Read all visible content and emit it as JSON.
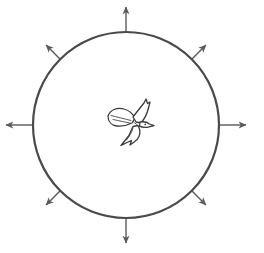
{
  "canvas": {
    "width": 264,
    "height": 253,
    "background_color": "#ffffff",
    "title": "Circle with eight radiating arrows and central bird emblem"
  },
  "circle": {
    "label": "boundary-circle",
    "center_x": 126,
    "center_y": 125,
    "radius": 93,
    "stroke_color": "#4a4a4a",
    "stroke_width": 2.2,
    "fill": "none"
  },
  "emblem": {
    "label": "flying bird emblem",
    "name": "bird-logo",
    "center_x": 131,
    "center_y": 124,
    "stroke_color": "#3a3a3a",
    "fill_color": "#ffffff",
    "stroke_width": 1.3
  },
  "arrows": {
    "stroke_color": "#5a5a5a",
    "stroke_width": 1.4,
    "head_color": "#5a5a5a",
    "items": [
      {
        "name": "arrow-north",
        "direction": "up",
        "angle_deg": 270,
        "start_radius": 93,
        "end_radius": 118,
        "length": 25
      },
      {
        "name": "arrow-northeast",
        "direction": "up-right",
        "angle_deg": 315,
        "start_radius": 93,
        "end_radius": 113,
        "length": 20
      },
      {
        "name": "arrow-east",
        "direction": "right",
        "angle_deg": 0,
        "start_radius": 93,
        "end_radius": 120,
        "length": 27
      },
      {
        "name": "arrow-southeast",
        "direction": "down-right",
        "angle_deg": 45,
        "start_radius": 93,
        "end_radius": 113,
        "length": 20
      },
      {
        "name": "arrow-south",
        "direction": "down",
        "angle_deg": 90,
        "start_radius": 93,
        "end_radius": 118,
        "length": 25
      },
      {
        "name": "arrow-southwest",
        "direction": "down-left",
        "angle_deg": 135,
        "start_radius": 93,
        "end_radius": 113,
        "length": 20
      },
      {
        "name": "arrow-west",
        "direction": "left",
        "angle_deg": 180,
        "start_radius": 93,
        "end_radius": 120,
        "length": 27
      },
      {
        "name": "arrow-northwest",
        "direction": "up-left",
        "angle_deg": 225,
        "start_radius": 93,
        "end_radius": 113,
        "length": 20
      }
    ],
    "count": 8
  }
}
